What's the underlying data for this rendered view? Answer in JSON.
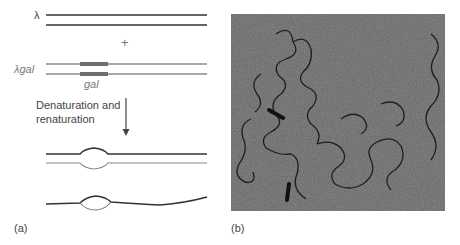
{
  "panel_a": {
    "label": "(a)",
    "lambda_label": "λ",
    "plus_sign": "+",
    "lambda_gal_label": "λgal",
    "gal_label": "gal",
    "step_label_line1": "Denaturation and",
    "step_label_line2": "renaturation"
  },
  "panel_b": {
    "label": "(b)",
    "description": "Electron micrograph of heteroduplex DNA molecules; arrows mark single-stranded loops"
  },
  "colors": {
    "lambda_strand": "#333333",
    "gal_strand": "#7a7a7a",
    "gal_segment": "#6e6e6e",
    "micrograph_bg": "#6b6b6b"
  }
}
